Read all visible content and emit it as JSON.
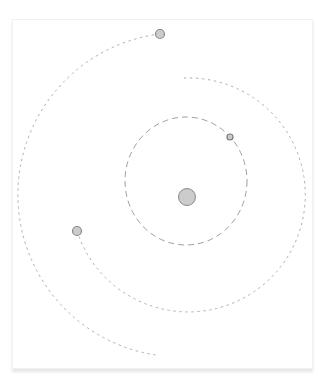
{
  "diagram": {
    "type": "orbital-system",
    "colors": {
      "background": "#ffffff",
      "card": "#ffffff",
      "orbit_stroke": "#a8a8a8",
      "body_fill": "#cccccc",
      "body_stroke": "#8a8a8a"
    },
    "sun": {
      "cx": 187,
      "cy": 197,
      "r": 8.5
    },
    "orbits": [
      {
        "name": "inner",
        "style": "dashed",
        "shape": "full-ellipse",
        "cx": 186,
        "cy": 181,
        "rx": 61,
        "ry": 64
      },
      {
        "name": "middle",
        "style": "dotted",
        "shape": "arc",
        "from": [
          184,
          78
        ],
        "to": [
          77,
          231
        ],
        "r": 117
      },
      {
        "name": "outer",
        "style": "dotted",
        "shape": "arc",
        "from": [
          160,
          34
        ],
        "to": [
          156,
          355
        ],
        "r": 162
      }
    ],
    "planets": [
      {
        "name": "inner-planet",
        "cx": 230,
        "cy": 137,
        "r": 3
      },
      {
        "name": "middle-planet",
        "cx": 77,
        "cy": 231,
        "r": 4.5
      },
      {
        "name": "outer-planet",
        "cx": 160,
        "cy": 34,
        "r": 4.5
      }
    ]
  }
}
